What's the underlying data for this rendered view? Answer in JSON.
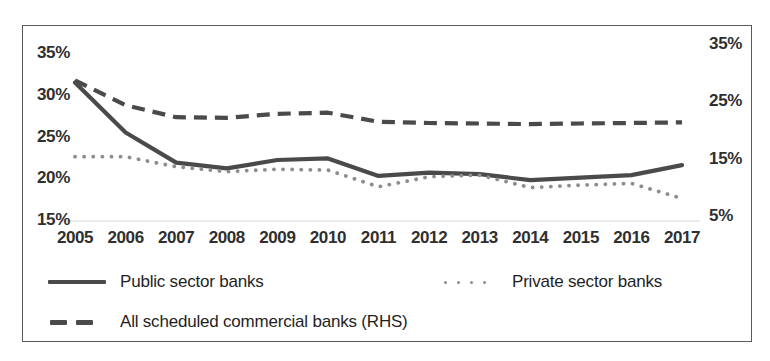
{
  "chart_data": {
    "type": "line",
    "title": "",
    "subtitle": "",
    "xlabel": "",
    "ylabel": "",
    "categories": [
      "2005",
      "2006",
      "2007",
      "2008",
      "2009",
      "2010",
      "2011",
      "2012",
      "2013",
      "2014",
      "2015",
      "2016",
      "2017"
    ],
    "left_axis": {
      "ticks": [
        "35%",
        "30%",
        "25%",
        "20%",
        "15%"
      ],
      "tick_values": [
        35,
        30,
        25,
        20,
        15
      ],
      "ylim": [
        15,
        35
      ],
      "unit": "%"
    },
    "right_axis": {
      "ticks": [
        "35%",
        "25%",
        "15%",
        "5%"
      ],
      "tick_values": [
        35,
        25,
        15,
        5
      ],
      "ylim": [
        5,
        35
      ],
      "unit": "%",
      "note": "RHS"
    },
    "grid": "single horizontal gridline at left-axis 15%",
    "legend_position": "bottom-left",
    "series": [
      {
        "name": "Public sector banks",
        "axis": "left",
        "style": "solid",
        "color": "#4a4a4a",
        "values": [
          31.6,
          25.6,
          22.0,
          21.3,
          22.3,
          22.5,
          20.4,
          20.8,
          20.6,
          19.9,
          20.2,
          20.5,
          21.7
        ]
      },
      {
        "name": "Private sector banks",
        "axis": "left",
        "style": "dotted",
        "color": "#8d8d8d",
        "values": [
          22.7,
          22.7,
          21.5,
          20.9,
          21.2,
          21.1,
          19.1,
          20.3,
          20.5,
          19.0,
          19.3,
          19.5,
          17.7
        ]
      },
      {
        "name": "All scheduled commercial banks (RHS)",
        "axis": "right",
        "style": "dashed",
        "color": "#4a4a4a",
        "values": [
          28.8,
          24.5,
          22.4,
          22.3,
          23.0,
          23.2,
          21.6,
          21.4,
          21.3,
          21.2,
          21.3,
          21.4,
          21.5
        ]
      }
    ]
  },
  "legend": {
    "items": [
      {
        "label": "Public sector banks",
        "key": "solid-line-key"
      },
      {
        "label": "Private sector banks",
        "key": "dotted-line-key"
      },
      {
        "label": "All scheduled commercial banks (RHS)",
        "key": "dashed-line-key"
      }
    ]
  }
}
